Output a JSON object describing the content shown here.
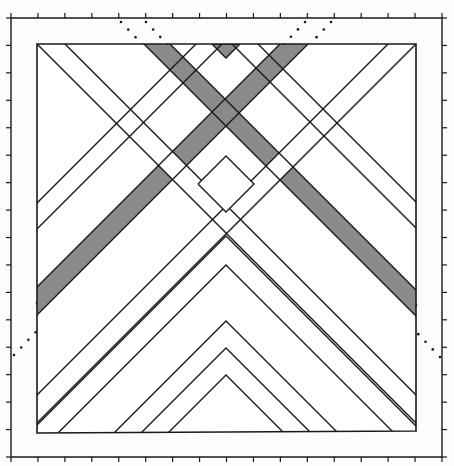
{
  "figure": {
    "colors": {
      "background": "#fcfcfa",
      "line": "#1a1a1a",
      "band_fill": "#ffffff",
      "shaded_fill": "#8a8a8a",
      "dot": "#1a1a1a"
    },
    "frame": {
      "ticks_top": 16,
      "ticks_bottom": 16,
      "ticks_left": 16,
      "ticks_right": 16
    },
    "elements": {
      "shaded_bands": 2,
      "white_bands": 4,
      "dotted_lines": 4,
      "chevrons": 5
    }
  }
}
